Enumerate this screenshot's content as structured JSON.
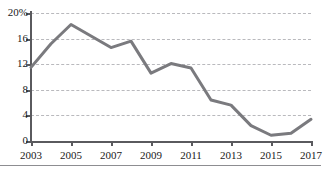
{
  "chart_data": {
    "type": "line",
    "title": "",
    "subtitle": "",
    "xlabel": "",
    "ylabel": "",
    "x": [
      2003,
      2004,
      2005,
      2006,
      2007,
      2008,
      2009,
      2010,
      2011,
      2012,
      2013,
      2014,
      2015,
      2016,
      2017
    ],
    "values": [
      11.5,
      15.2,
      18.2,
      16.4,
      14.6,
      15.6,
      10.6,
      12.1,
      11.4,
      6.4,
      5.6,
      2.4,
      0.9,
      1.2,
      3.4
    ],
    "series": [
      {
        "name": "",
        "color": "#7a7a7e",
        "values": [
          11.5,
          15.2,
          18.2,
          16.4,
          14.6,
          15.6,
          10.6,
          12.1,
          11.4,
          6.4,
          5.6,
          2.4,
          0.9,
          1.2,
          3.4
        ]
      }
    ],
    "xlim": [
      2003,
      2017
    ],
    "ylim": [
      0,
      20
    ],
    "grid": true,
    "legend": "none",
    "y_ticks": [
      {
        "value": 20,
        "label": "20%"
      },
      {
        "value": 16,
        "label": "16"
      },
      {
        "value": 12,
        "label": "12"
      },
      {
        "value": 8,
        "label": "8"
      },
      {
        "value": 4,
        "label": "4"
      },
      {
        "value": 0,
        "label": "0"
      }
    ],
    "x_ticks": [
      {
        "value": 2003,
        "label": "2003"
      },
      {
        "value": 2005,
        "label": "2005"
      },
      {
        "value": 2007,
        "label": "2007"
      },
      {
        "value": 2009,
        "label": "2009"
      },
      {
        "value": 2011,
        "label": "2011"
      },
      {
        "value": 2013,
        "label": "2013"
      },
      {
        "value": 2015,
        "label": "2015"
      },
      {
        "value": 2017,
        "label": "2017"
      }
    ],
    "colors": {
      "line": "#7a7a7e",
      "axis": "#5a5a5e",
      "gridline": "#b9b9bd",
      "text": "#1a1a1a",
      "background": "#ffffff"
    }
  }
}
